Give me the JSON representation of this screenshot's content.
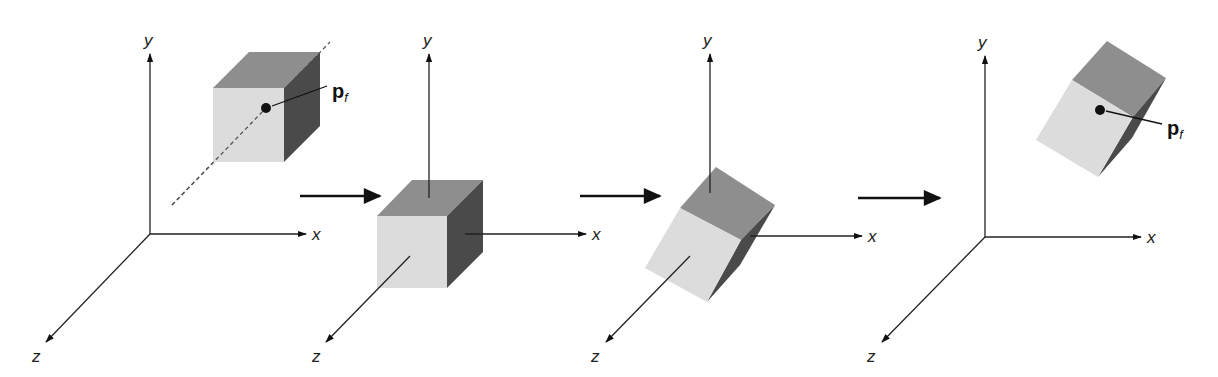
{
  "figure": {
    "colors": {
      "face_front": "#dcdcdc",
      "face_top": "#8e8e8e",
      "face_side": "#4a4a4a",
      "axis": "#222222",
      "background": "#ffffff"
    },
    "axis_labels": {
      "x": "x",
      "y": "y",
      "z": "z"
    },
    "point_label": {
      "main": "p",
      "subscript": "f"
    },
    "panels": [
      {
        "id": 1,
        "stage": "original position with fixed point"
      },
      {
        "id": 2,
        "stage": "translated to origin"
      },
      {
        "id": 3,
        "stage": "rotated about origin"
      },
      {
        "id": 4,
        "stage": "translated back to fixed point"
      }
    ],
    "flow_arrows": 3
  }
}
